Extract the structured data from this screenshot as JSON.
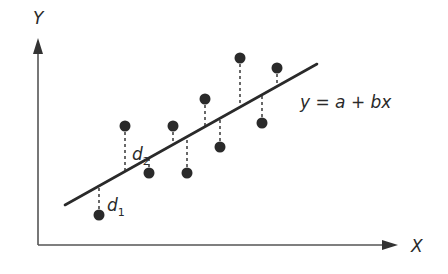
{
  "diagram": {
    "colors": {
      "ink": "#2a2a2a",
      "axis": "#555555",
      "background": "#ffffff"
    },
    "axes": {
      "x_label": "X",
      "y_label": "Y",
      "origin": [
        38,
        245
      ],
      "x_end": [
        398,
        245
      ],
      "y_end": [
        38,
        38
      ]
    },
    "regression_line": {
      "equation": "y = a + bx",
      "start": [
        65,
        205
      ],
      "end": [
        317,
        64
      ],
      "label_pos": [
        300,
        108
      ]
    },
    "points": [
      {
        "x": 99,
        "y": 215,
        "line_y": 186
      },
      {
        "x": 125,
        "y": 126,
        "line_y": 171
      },
      {
        "x": 149,
        "y": 173,
        "line_y": 158
      },
      {
        "x": 173,
        "y": 126,
        "line_y": 144
      },
      {
        "x": 187,
        "y": 173,
        "line_y": 136
      },
      {
        "x": 205,
        "y": 99,
        "line_y": 126
      },
      {
        "x": 220,
        "y": 147,
        "line_y": 117
      },
      {
        "x": 240,
        "y": 58,
        "line_y": 107
      },
      {
        "x": 262,
        "y": 123,
        "line_y": 95
      },
      {
        "x": 277,
        "y": 68,
        "line_y": 86
      }
    ],
    "residual_labels": [
      {
        "base": "d",
        "sub": "1",
        "x": 107,
        "y": 211
      },
      {
        "base": "d",
        "sub": "2",
        "x": 132,
        "y": 160
      }
    ]
  }
}
